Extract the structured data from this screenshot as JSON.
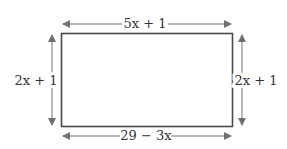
{
  "diagram": {
    "type": "rectangle-with-dimension-labels",
    "labels": {
      "top": "5x + 1",
      "bottom": "29 − 3x",
      "left": "2x + 1",
      "right": "2x + 1"
    },
    "colors": {
      "rect_stroke": "#4a4a4a",
      "arrow": "#707070",
      "text": "#333333"
    }
  }
}
